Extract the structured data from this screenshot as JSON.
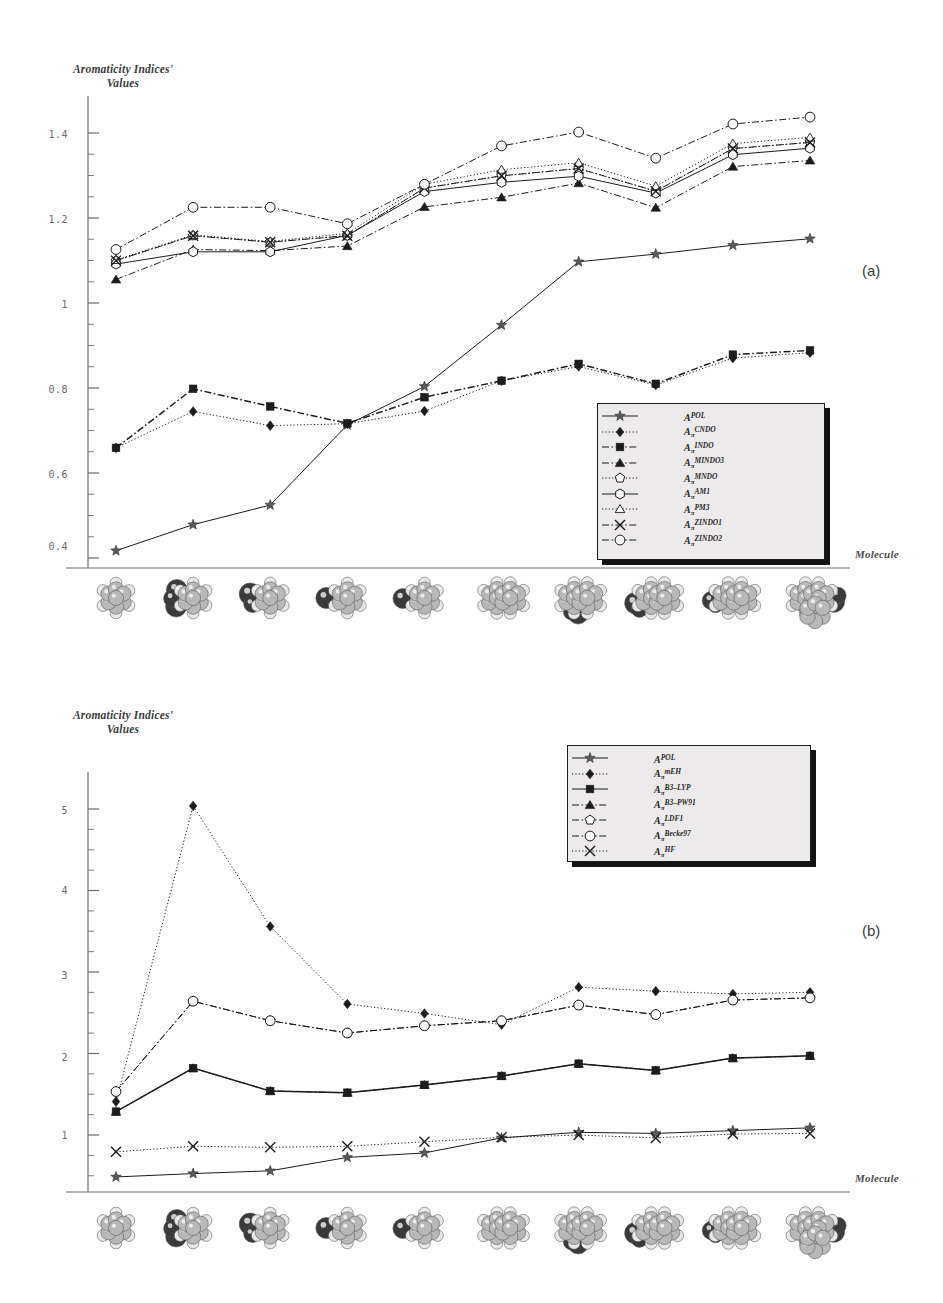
{
  "figure": {
    "panels": [
      {
        "tag": "(a)",
        "yaxis_title_line1": "Aromaticity Indices'",
        "yaxis_title_line2": "Values",
        "xaxis_label": "Molecule"
      },
      {
        "tag": "(b)",
        "yaxis_title_line1": "Aromaticity Indices'",
        "yaxis_title_line2": "Values",
        "xaxis_label": "Molecule"
      }
    ]
  },
  "chart_data": [
    {
      "type": "line",
      "panel": "(a)",
      "title": "",
      "xlabel": "Molecule",
      "ylabel": "Aromaticity Indices' Values",
      "x": [
        1,
        2,
        3,
        4,
        5,
        6,
        7,
        8,
        9,
        10
      ],
      "ylim": [
        0.33,
        1.56
      ],
      "yticks": [
        0.4,
        0.6,
        0.8,
        1,
        1.2,
        1.4
      ],
      "ytick_labels": [
        "0.4",
        "0.6",
        "0.8",
        "1",
        "1.2",
        "1.4"
      ],
      "yminor_step": 0.05,
      "grid": false,
      "legend_position": "inside-lower-right",
      "series": [
        {
          "name": "APOL",
          "label_base": "A",
          "label_sub": "",
          "label_sup": "POL",
          "marker": "star",
          "line": "solid",
          "values": [
            0.375,
            0.443,
            0.494,
            0.703,
            0.803,
            0.963,
            1.128,
            1.148,
            1.171,
            1.188
          ]
        },
        {
          "name": "CNDO",
          "label_base": "A",
          "label_sub": "π",
          "label_sup": "CNDO",
          "marker": "diamond-filled",
          "line": "dotted",
          "values": [
            0.643,
            0.738,
            0.701,
            0.706,
            0.739,
            0.818,
            0.855,
            0.807,
            0.877,
            0.891
          ]
        },
        {
          "name": "INDO",
          "label_base": "A",
          "label_sub": "π",
          "label_sup": "INDO",
          "marker": "square-filled",
          "line": "dash-dot",
          "values": [
            0.643,
            0.797,
            0.751,
            0.707,
            0.775,
            0.818,
            0.862,
            0.81,
            0.886,
            0.897
          ]
        },
        {
          "name": "MINDO3",
          "label_base": "A",
          "label_sub": "π",
          "label_sup": "MINDO3",
          "marker": "triangle-filled",
          "line": "dash-dot",
          "values": [
            1.082,
            1.16,
            1.157,
            1.169,
            1.271,
            1.296,
            1.333,
            1.269,
            1.376,
            1.392
          ]
        },
        {
          "name": "MNDO",
          "label_base": "A",
          "label_sub": "π",
          "label_sup": "MNDO",
          "marker": "pentagon-open",
          "line": "dotted",
          "values": [
            1.131,
            1.196,
            1.179,
            1.196,
            1.32,
            1.352,
            1.371,
            1.312,
            1.423,
            1.439
          ]
        },
        {
          "name": "AM1",
          "label_base": "A",
          "label_sub": "π",
          "label_sup": "AM1",
          "marker": "hexagon-open",
          "line": "solid",
          "values": [
            1.122,
            1.154,
            1.154,
            1.197,
            1.311,
            1.335,
            1.351,
            1.307,
            1.407,
            1.424
          ]
        },
        {
          "name": "PM3",
          "label_base": "A",
          "label_sub": "π",
          "label_sup": "PM3",
          "marker": "triangle-open",
          "line": "dotted",
          "values": [
            1.133,
            1.198,
            1.181,
            1.202,
            1.33,
            1.368,
            1.386,
            1.325,
            1.436,
            1.452
          ]
        },
        {
          "name": "ZINDO1",
          "label_base": "A",
          "label_sub": "π",
          "label_sup": "ZINDO1",
          "marker": "cross",
          "line": "dash-dot",
          "values": [
            1.131,
            1.196,
            1.179,
            1.196,
            1.32,
            1.352,
            1.371,
            1.312,
            1.423,
            1.439
          ]
        },
        {
          "name": "ZINDO2",
          "label_base": "A",
          "label_sub": "π",
          "label_sup": "ZINDO2",
          "marker": "circle-open",
          "line": "dash-dot",
          "values": [
            1.16,
            1.27,
            1.27,
            1.227,
            1.33,
            1.43,
            1.466,
            1.398,
            1.487,
            1.505
          ]
        }
      ]
    },
    {
      "type": "line",
      "panel": "(b)",
      "title": "",
      "xlabel": "Molecule",
      "ylabel": "Aromaticity Indices' Values",
      "x": [
        1,
        2,
        3,
        4,
        5,
        6,
        7,
        8,
        9,
        10
      ],
      "ylim": [
        0,
        7.6
      ],
      "yticks": [
        1,
        2,
        3,
        4,
        5
      ],
      "ytick_labels": [
        "1",
        "2",
        "3",
        "4",
        "5"
      ],
      "yminor_step": 0.25,
      "grid": false,
      "legend_position": "inside-upper-right",
      "series": [
        {
          "name": "APOL",
          "label_base": "A",
          "label_sub": "",
          "label_sup": "POL",
          "marker": "star",
          "line": "solid",
          "values": [
            0.27,
            0.33,
            0.38,
            0.62,
            0.7,
            0.97,
            1.07,
            1.05,
            1.1,
            1.15
          ]
        },
        {
          "name": "mEH",
          "label_base": "A",
          "label_sub": "π",
          "label_sup": "mEH",
          "marker": "diamond-filled",
          "line": "dotted",
          "values": [
            1.62,
            6.92,
            4.76,
            3.37,
            3.2,
            3.0,
            3.67,
            3.6,
            3.55,
            3.58
          ]
        },
        {
          "name": "B3-LYP",
          "label_base": "A",
          "label_sub": "π",
          "label_sup": "B3–LYP",
          "marker": "square-filled",
          "line": "solid",
          "values": [
            1.44,
            2.22,
            1.81,
            1.78,
            1.92,
            2.08,
            2.3,
            2.18,
            2.4,
            2.44
          ]
        },
        {
          "name": "B3-PW91",
          "label_base": "A",
          "label_sub": "π",
          "label_sup": "B3–PW91",
          "marker": "triangle-filled",
          "line": "dash-dot",
          "values": [
            1.44,
            2.22,
            1.81,
            1.78,
            1.92,
            2.08,
            2.3,
            2.18,
            2.4,
            2.44
          ]
        },
        {
          "name": "LDF1",
          "label_base": "A",
          "label_sub": "π",
          "label_sup": "LDF1",
          "marker": "pentagon-open",
          "line": "dash-dot",
          "values": [
            1.8,
            3.42,
            3.07,
            2.85,
            2.98,
            3.07,
            3.35,
            3.18,
            3.44,
            3.48
          ]
        },
        {
          "name": "Becke97",
          "label_base": "A",
          "label_sub": "π",
          "label_sup": "Becke97",
          "marker": "circle-open",
          "line": "dash-dot",
          "values": [
            1.8,
            3.42,
            3.07,
            2.85,
            2.98,
            3.07,
            3.35,
            3.18,
            3.44,
            3.48
          ]
        },
        {
          "name": "HF",
          "label_base": "A",
          "label_sub": "π",
          "label_sup": "HF",
          "marker": "cross",
          "line": "dotted",
          "values": [
            0.72,
            0.82,
            0.8,
            0.82,
            0.9,
            0.98,
            1.02,
            0.97,
            1.04,
            1.05
          ]
        }
      ]
    }
  ],
  "panel_a_ticks": {
    "labels": [
      "1.4",
      "1.2",
      "1",
      "0.8",
      "0.6",
      "0.4"
    ]
  },
  "panel_b_ticks": {
    "labels": [
      "5",
      "4",
      "3",
      "2",
      "1"
    ]
  },
  "molecules": {
    "count": 10,
    "description": "space-filling-molecular-model"
  }
}
